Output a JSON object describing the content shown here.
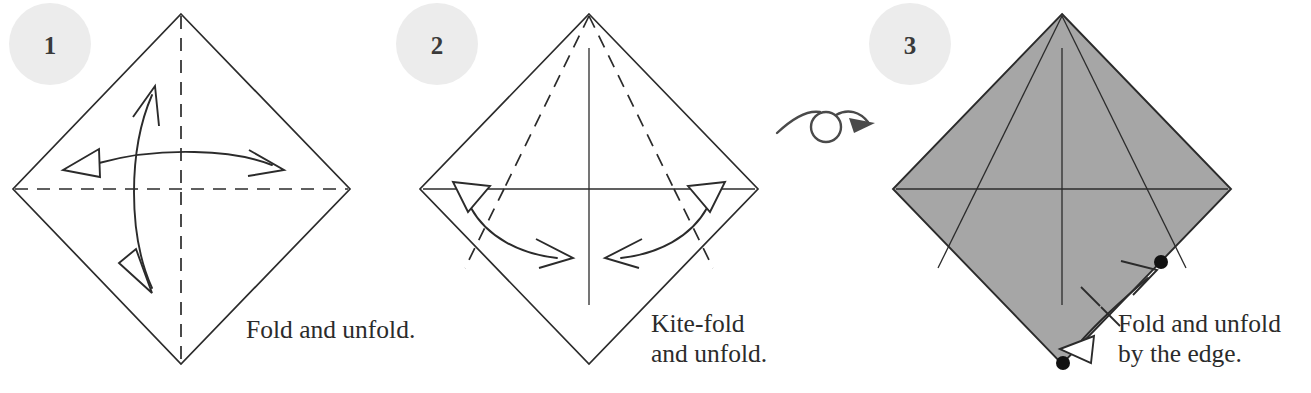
{
  "document": {
    "title": "Origami folding instructions",
    "background_color": "#ffffff",
    "width": 1311,
    "height": 393
  },
  "palette": {
    "paper_front": "#ffffff",
    "paper_back_shaded": "#a6a6a6",
    "line": "#2b2b2b",
    "badge_fill": "#ececec",
    "badge_text": "#3a3a3a",
    "turnover_symbol": "#4a4a4a",
    "reference_dot": "#111111"
  },
  "steps": [
    {
      "number": "1",
      "badge": {
        "cx": 50,
        "cy": 44,
        "r": 41
      },
      "caption_lines": [
        "Fold and unfold."
      ],
      "caption_x": 246,
      "caption_y": 338,
      "shape": "diamond",
      "fill": "white",
      "creases": [
        "vertical-valley",
        "horizontal-valley"
      ],
      "arrows": [
        {
          "name": "vertical-fold-unfold-arrow",
          "type": "double-headed-curved"
        },
        {
          "name": "horizontal-fold-unfold-arrow",
          "type": "double-headed-curved"
        }
      ]
    },
    {
      "number": "2",
      "badge": {
        "cx": 437,
        "cy": 44,
        "r": 41
      },
      "caption_lines": [
        "Kite-fold",
        "and unfold."
      ],
      "caption_x": 651,
      "caption_y": 332,
      "shape": "diamond",
      "fill": "white",
      "creases": [
        "vertical-solid",
        "horizontal-solid",
        "kite-left-valley",
        "kite-right-valley"
      ],
      "arrows": [
        {
          "name": "kite-left-arrow",
          "type": "double-headed-curved"
        },
        {
          "name": "kite-right-arrow",
          "type": "double-headed-curved"
        }
      ]
    },
    {
      "number": "3",
      "badge": {
        "cx": 910,
        "cy": 44,
        "r": 41
      },
      "caption_lines": [
        "Fold and unfold",
        "by the edge."
      ],
      "caption_x": 1118,
      "caption_y": 332,
      "shape": "diamond",
      "fill": "shaded",
      "creases": [
        "vertical-solid",
        "horizontal-solid",
        "kite-left-solid",
        "kite-right-solid"
      ],
      "reference_dots": [
        {
          "name": "dot-bottom-vertex",
          "cx": 1063,
          "cy": 363,
          "r": 7
        },
        {
          "name": "dot-right-kite-intersection",
          "cx": 1161,
          "cy": 262,
          "r": 7
        }
      ],
      "arrows": [
        {
          "name": "edge-fold-unfold-arrow",
          "type": "double-headed-curved"
        }
      ],
      "tick_marks": 2
    }
  ],
  "symbols": [
    {
      "name": "turn-over-symbol",
      "label": "turn over",
      "between_steps": [
        "2",
        "3"
      ],
      "x": 775,
      "y": 110
    }
  ]
}
